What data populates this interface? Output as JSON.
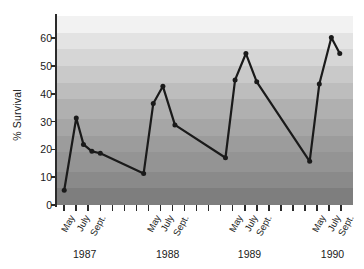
{
  "chart_data": {
    "type": "line",
    "title": "",
    "xlabel": "",
    "ylabel": "% Survival",
    "ylim": [
      0,
      68
    ],
    "yticks": [
      0,
      10,
      20,
      30,
      40,
      50,
      60
    ],
    "ytick_labels": [
      "0",
      "10",
      "20",
      "30",
      "40",
      "50",
      "60"
    ],
    "grid": false,
    "legend": "none",
    "background_style": "horizontal grayscale bands, light at top, dark at bottom",
    "marker": "filled circle",
    "line_color": "#1a1a1a",
    "group_labels": [
      "1987",
      "1988",
      "1989",
      "1990"
    ],
    "month_tick_labels": [
      "May",
      "July",
      "Sept."
    ],
    "series": [
      {
        "name": "% Survival",
        "points": [
          {
            "group": "1987",
            "month": "May",
            "x": 0.0,
            "y": 5.3
          },
          {
            "group": "1987",
            "month": "June",
            "x": 1.0,
            "y": 31.3
          },
          {
            "group": "1987",
            "month": "July",
            "x": 1.6,
            "y": 21.8
          },
          {
            "group": "1987",
            "month": "Aug.",
            "x": 2.3,
            "y": 19.3
          },
          {
            "group": "1987",
            "month": "Sept.",
            "x": 3.0,
            "y": 18.6
          },
          {
            "group": "1987",
            "month": "Oct.",
            "x": 6.6,
            "y": 11.3
          },
          {
            "group": "1988",
            "month": "May",
            "x": 7.4,
            "y": 36.5
          },
          {
            "group": "1988",
            "month": "July",
            "x": 8.2,
            "y": 42.7
          },
          {
            "group": "1988",
            "month": "Aug.",
            "x": 9.2,
            "y": 28.8
          },
          {
            "group": "1988",
            "month": "Sept.",
            "x": 13.4,
            "y": 17.0
          },
          {
            "group": "1989",
            "month": "May",
            "x": 14.2,
            "y": 45.0
          },
          {
            "group": "1989",
            "month": "July",
            "x": 15.1,
            "y": 54.5
          },
          {
            "group": "1989",
            "month": "Aug.",
            "x": 16.0,
            "y": 44.3
          },
          {
            "group": "1989",
            "month": "Sept.",
            "x": 20.4,
            "y": 15.7
          },
          {
            "group": "1990",
            "month": "May",
            "x": 21.2,
            "y": 43.5
          },
          {
            "group": "1990",
            "month": "July",
            "x": 22.2,
            "y": 60.3
          },
          {
            "group": "1990",
            "month": "Sept.",
            "x": 22.9,
            "y": 54.5
          }
        ]
      }
    ],
    "bands": [
      {
        "from": 62.0,
        "to": 68.0,
        "color": "#f2f2f2"
      },
      {
        "from": 56.0,
        "to": 62.0,
        "color": "#e3e3e3"
      },
      {
        "from": 50.0,
        "to": 56.0,
        "color": "#d6d6d6"
      },
      {
        "from": 44.0,
        "to": 50.0,
        "color": "#c9c9c9"
      },
      {
        "from": 38.0,
        "to": 44.0,
        "color": "#bdbdbd"
      },
      {
        "from": 31.0,
        "to": 38.0,
        "color": "#b0b0b0"
      },
      {
        "from": 25.0,
        "to": 31.0,
        "color": "#a6a6a6"
      },
      {
        "from": 19.0,
        "to": 25.0,
        "color": "#9c9c9c"
      },
      {
        "from": 12.0,
        "to": 19.0,
        "color": "#949494"
      },
      {
        "from": 6.0,
        "to": 12.0,
        "color": "#8a8a8a"
      },
      {
        "from": 0.0,
        "to": 6.0,
        "color": "#7e7e7e"
      }
    ],
    "x_tick_positions": [
      0.0,
      1.0,
      2.0,
      3.0,
      4.0,
      5.0,
      6.0,
      7.0,
      8.0,
      9.0,
      10.0,
      11.0,
      12.0,
      13.0,
      14.0,
      15.0,
      16.0,
      17.0,
      18.0,
      19.0,
      20.0,
      21.0,
      22.0,
      23.0
    ],
    "month_label_positions": [
      {
        "label": "May",
        "x": 0.2
      },
      {
        "label": "July",
        "x": 1.5
      },
      {
        "label": "Sept.",
        "x": 2.8
      },
      {
        "label": "May",
        "x": 7.4
      },
      {
        "label": "July",
        "x": 8.5
      },
      {
        "label": "Sept.",
        "x": 9.7
      },
      {
        "label": "May",
        "x": 14.2
      },
      {
        "label": "July",
        "x": 15.4
      },
      {
        "label": "Sept.",
        "x": 16.6
      },
      {
        "label": "May",
        "x": 21.1
      },
      {
        "label": "July",
        "x": 22.3
      },
      {
        "label": "Sept.",
        "x": 23.4
      }
    ],
    "year_label_positions": [
      {
        "label": "1987",
        "x": 1.7
      },
      {
        "label": "1988",
        "x": 8.6
      },
      {
        "label": "1989",
        "x": 15.4
      },
      {
        "label": "1990",
        "x": 22.3
      }
    ],
    "x_domain": [
      -0.6,
      24.0
    ]
  }
}
